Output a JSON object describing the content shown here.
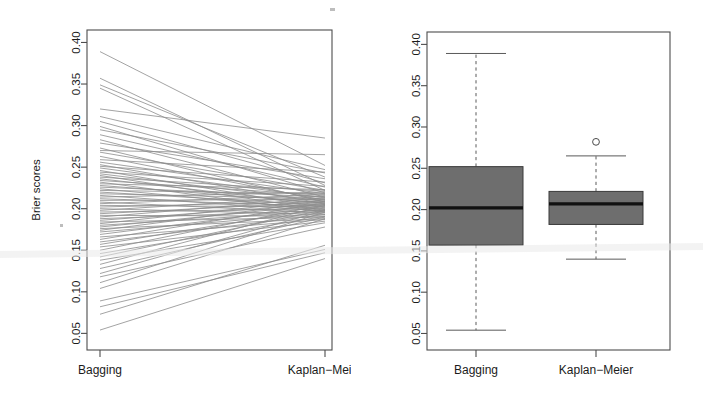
{
  "figure": {
    "title": "",
    "background": "#ffffff",
    "width": 703,
    "height": 406,
    "panels": 2
  },
  "axis": {
    "ylabel": "Brier scores",
    "yticks": [
      "0.05",
      "0.10",
      "0.15",
      "0.20",
      "0.25",
      "0.30",
      "0.35",
      "0.40"
    ],
    "ytick_values": [
      0.05,
      0.1,
      0.15,
      0.2,
      0.25,
      0.3,
      0.35,
      0.4
    ],
    "ylim": [
      0.03,
      0.415
    ],
    "categories": [
      "Bagging",
      "Kaplan−Meier"
    ]
  },
  "colors": {
    "line": "#8c8c8c",
    "box_fill": "#6e6e6e",
    "box_stroke": "#3a3a3a",
    "median": "#111111",
    "whisker": "#5a5a5a",
    "frame": "#4d4d4d",
    "text": "#1b1b1b",
    "background": "#ffffff"
  },
  "chart_data": [
    {
      "type": "line",
      "name": "paired-slope-plot",
      "title": "",
      "xlabel": "",
      "ylabel": "Brier scores",
      "categories": [
        "Bagging",
        "Kaplan−Meier"
      ],
      "ylim": [
        0.03,
        0.415
      ],
      "yticks": [
        0.05,
        0.1,
        0.15,
        0.2,
        0.25,
        0.3,
        0.35,
        0.4
      ],
      "grid": false,
      "legend": "none",
      "series_note": "Each line connects the Brier score of one dataset under Bagging (left) and Kaplan-Meier (right).",
      "pairs": [
        [
          0.389,
          0.252
        ],
        [
          0.357,
          0.228
        ],
        [
          0.349,
          0.238
        ],
        [
          0.345,
          0.222
        ],
        [
          0.32,
          0.285
        ],
        [
          0.311,
          0.247
        ],
        [
          0.305,
          0.231
        ],
        [
          0.299,
          0.219
        ],
        [
          0.295,
          0.243
        ],
        [
          0.289,
          0.226
        ],
        [
          0.283,
          0.214
        ],
        [
          0.279,
          0.236
        ],
        [
          0.273,
          0.208
        ],
        [
          0.27,
          0.265
        ],
        [
          0.268,
          0.222
        ],
        [
          0.263,
          0.21
        ],
        [
          0.259,
          0.244
        ],
        [
          0.256,
          0.218
        ],
        [
          0.253,
          0.206
        ],
        [
          0.251,
          0.232
        ],
        [
          0.249,
          0.213
        ],
        [
          0.246,
          0.201
        ],
        [
          0.244,
          0.227
        ],
        [
          0.242,
          0.209
        ],
        [
          0.24,
          0.198
        ],
        [
          0.238,
          0.221
        ],
        [
          0.236,
          0.205
        ],
        [
          0.234,
          0.216
        ],
        [
          0.232,
          0.196
        ],
        [
          0.23,
          0.223
        ],
        [
          0.228,
          0.207
        ],
        [
          0.226,
          0.214
        ],
        [
          0.224,
          0.199
        ],
        [
          0.222,
          0.218
        ],
        [
          0.22,
          0.204
        ],
        [
          0.218,
          0.212
        ],
        [
          0.216,
          0.197
        ],
        [
          0.214,
          0.22
        ],
        [
          0.212,
          0.203
        ],
        [
          0.21,
          0.211
        ],
        [
          0.208,
          0.195
        ],
        [
          0.206,
          0.217
        ],
        [
          0.204,
          0.202
        ],
        [
          0.202,
          0.209
        ],
        [
          0.2,
          0.193
        ],
        [
          0.198,
          0.215
        ],
        [
          0.196,
          0.2
        ],
        [
          0.194,
          0.208
        ],
        [
          0.192,
          0.191
        ],
        [
          0.19,
          0.213
        ],
        [
          0.188,
          0.198
        ],
        [
          0.186,
          0.206
        ],
        [
          0.184,
          0.19
        ],
        [
          0.182,
          0.211
        ],
        [
          0.18,
          0.197
        ],
        [
          0.178,
          0.205
        ],
        [
          0.176,
          0.188
        ],
        [
          0.174,
          0.209
        ],
        [
          0.172,
          0.195
        ],
        [
          0.169,
          0.203
        ],
        [
          0.166,
          0.187
        ],
        [
          0.163,
          0.207
        ],
        [
          0.16,
          0.193
        ],
        [
          0.157,
          0.201
        ],
        [
          0.154,
          0.185
        ],
        [
          0.15,
          0.205
        ],
        [
          0.146,
          0.191
        ],
        [
          0.142,
          0.199
        ],
        [
          0.138,
          0.183
        ],
        [
          0.133,
          0.204
        ],
        [
          0.128,
          0.19
        ],
        [
          0.122,
          0.198
        ],
        [
          0.118,
          0.178
        ],
        [
          0.111,
          0.196
        ],
        [
          0.104,
          0.188
        ],
        [
          0.089,
          0.151
        ],
        [
          0.082,
          0.147
        ],
        [
          0.073,
          0.156
        ],
        [
          0.054,
          0.14
        ]
      ]
    },
    {
      "type": "boxplot",
      "name": "brier-score-boxplots",
      "title": "",
      "xlabel": "",
      "ylabel": "",
      "categories": [
        "Bagging",
        "Kaplan−Meier"
      ],
      "ylim": [
        0.03,
        0.415
      ],
      "yticks": [
        0.05,
        0.1,
        0.15,
        0.2,
        0.25,
        0.3,
        0.35,
        0.4
      ],
      "grid": false,
      "legend": "none",
      "boxes": [
        {
          "label": "Bagging",
          "whisker_low": 0.054,
          "q1": 0.157,
          "median": 0.202,
          "q3": 0.252,
          "whisker_high": 0.389,
          "outliers": []
        },
        {
          "label": "Kaplan−Meier",
          "whisker_low": 0.14,
          "q1": 0.182,
          "median": 0.207,
          "q3": 0.222,
          "whisker_high": 0.265,
          "outliers": [
            0.282
          ]
        }
      ]
    }
  ]
}
